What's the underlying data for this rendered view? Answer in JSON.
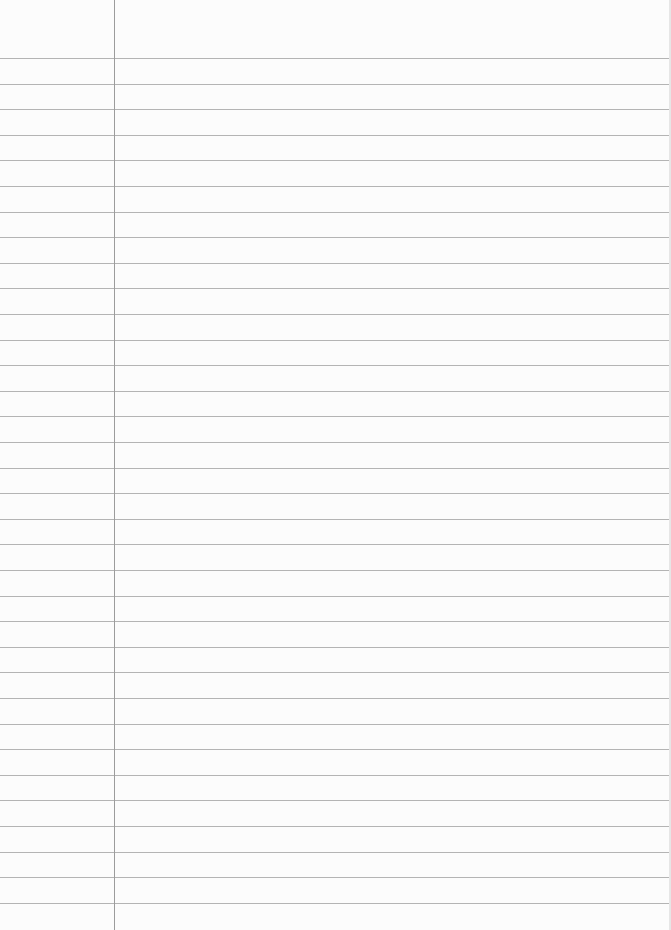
{
  "paper": {
    "type": "ruled-notebook-page",
    "background_color": "#fcfcfc",
    "rule_color": "#b4b4b4",
    "margin_color": "#9c9c9c",
    "margin_x": 114,
    "first_rule_y": 58,
    "rule_spacing": 25.6,
    "rule_count": 34
  }
}
